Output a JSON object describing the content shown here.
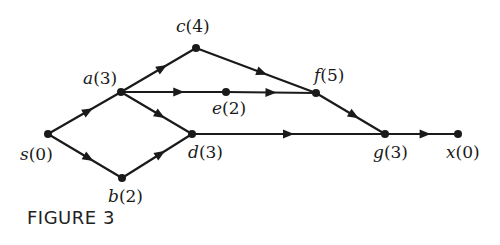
{
  "caption": "FIGURE 3",
  "nodes": [
    {
      "id": "s",
      "label": "s",
      "value": "(0)"
    },
    {
      "id": "a",
      "label": "a",
      "value": "(3)"
    },
    {
      "id": "b",
      "label": "b",
      "value": "(2)"
    },
    {
      "id": "c",
      "label": "c",
      "value": "(4)"
    },
    {
      "id": "d",
      "label": "d",
      "value": "(3)"
    },
    {
      "id": "e",
      "label": "e",
      "value": "(2)"
    },
    {
      "id": "f",
      "label": "f",
      "value": "(5)"
    },
    {
      "id": "g",
      "label": "g",
      "value": "(3)"
    },
    {
      "id": "x",
      "label": "x",
      "value": "(0)"
    }
  ],
  "edges": [
    {
      "from": "s",
      "to": "a"
    },
    {
      "from": "s",
      "to": "b"
    },
    {
      "from": "a",
      "to": "c"
    },
    {
      "from": "a",
      "to": "f",
      "via": "e"
    },
    {
      "from": "a",
      "to": "d"
    },
    {
      "from": "b",
      "to": "d"
    },
    {
      "from": "c",
      "to": "f"
    },
    {
      "from": "f",
      "to": "g"
    },
    {
      "from": "d",
      "to": "g"
    },
    {
      "from": "g",
      "to": "x"
    }
  ],
  "colors": {
    "ink": "#1a1a1a"
  }
}
